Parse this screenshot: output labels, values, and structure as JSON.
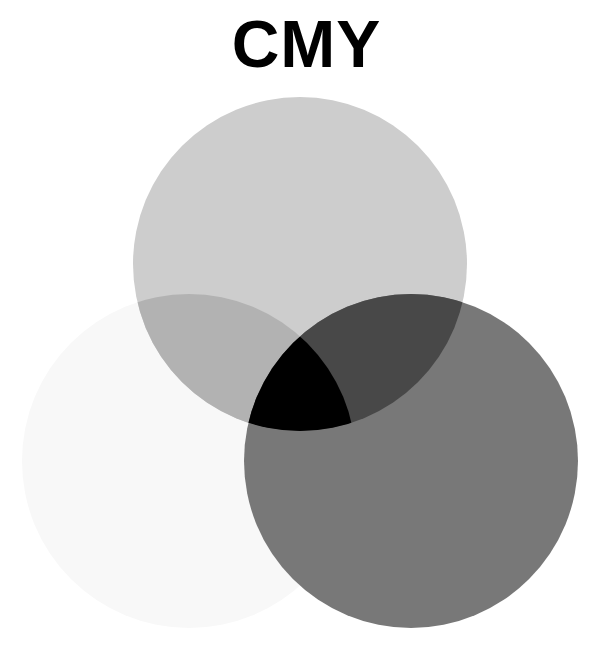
{
  "title": "CMY",
  "circles": [
    {
      "name": "yellow",
      "cx": 189,
      "cy": 461,
      "r": 167,
      "fill": "#f8f8f8"
    },
    {
      "name": "cyan",
      "cx": 300,
      "cy": 264,
      "r": 167,
      "fill": "#cdcdcd"
    },
    {
      "name": "magenta",
      "cx": 411,
      "cy": 461,
      "r": 167,
      "fill": "#787878"
    }
  ],
  "overlaps": {
    "cyan_yellow": "#b2b2b2",
    "cyan_magenta": "#484848",
    "magenta_yellow": "#767676",
    "all": "#000000"
  }
}
